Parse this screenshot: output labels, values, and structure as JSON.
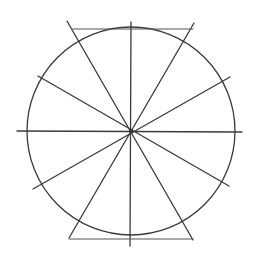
{
  "diagram": {
    "title": "",
    "colors": {
      "stroke": "#3a3a3a",
      "background": "#ffffff"
    },
    "circle": {
      "cx": 131,
      "cy": 131,
      "r": 104
    },
    "lines": [
      {
        "name": "vertical",
        "x1": 131,
        "y1": 22,
        "x2": 130,
        "y2": 246
      },
      {
        "name": "horizontal",
        "x1": 17,
        "y1": 131,
        "x2": 242,
        "y2": 132
      },
      {
        "name": "diag-30-a",
        "x1": 38,
        "y1": 76,
        "x2": 229,
        "y2": 186
      },
      {
        "name": "diag-30-b",
        "x1": 33,
        "y1": 189,
        "x2": 230,
        "y2": 77
      },
      {
        "name": "diag-60-a",
        "x1": 67,
        "y1": 21,
        "x2": 193,
        "y2": 240
      },
      {
        "name": "diag-60-b",
        "x1": 194,
        "y1": 23,
        "x2": 69,
        "y2": 238
      }
    ],
    "chords": [
      {
        "name": "top-chord",
        "x1": 72,
        "y1": 29,
        "x2": 193,
        "y2": 29
      },
      {
        "name": "bottom-chord",
        "x1": 69,
        "y1": 239,
        "x2": 193,
        "y2": 239
      }
    ]
  }
}
